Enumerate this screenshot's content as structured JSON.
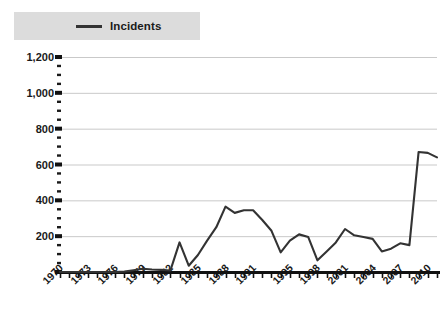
{
  "legend": {
    "label": "Incidents",
    "swatch_color": "#333333",
    "background_color": "#dcdcdc"
  },
  "axis": {
    "y_tick_labels": [
      "1,200",
      "1,000",
      "800",
      "600",
      "400",
      "200"
    ],
    "x_tick_labels": [
      "1970",
      "1973",
      "1976",
      "1979",
      "1982",
      "1985",
      "1988",
      "1991",
      "1995",
      "1998",
      "2001",
      "2004",
      "2007",
      "2010"
    ]
  },
  "chart_data": {
    "type": "line",
    "title": "",
    "xlabel": "",
    "ylabel": "",
    "ylim": [
      0,
      1200
    ],
    "ytick_values": [
      0,
      200,
      400,
      600,
      800,
      1000,
      1200
    ],
    "ytick_labels": [
      "",
      "200",
      "400",
      "600",
      "800",
      "1,000",
      "1,200"
    ],
    "minor_yticks": true,
    "grid": "horizontal",
    "legend_position": "top-left",
    "line_color": "#333333",
    "line_width": 2,
    "x": [
      1970,
      1971,
      1972,
      1973,
      1974,
      1975,
      1976,
      1977,
      1978,
      1979,
      1980,
      1981,
      1982,
      1983,
      1984,
      1985,
      1986,
      1987,
      1988,
      1989,
      1990,
      1991,
      1992,
      1993,
      1994,
      1995,
      1996,
      1997,
      1998,
      1999,
      2000,
      2001,
      2002,
      2003,
      2004,
      2005,
      2006,
      2007,
      2008,
      2009,
      2010,
      2011
    ],
    "xtick_labels_shown": [
      "1970",
      "1973",
      "1976",
      "1979",
      "1982",
      "1985",
      "1988",
      "1991",
      "1995",
      "1998",
      "2001",
      "2004",
      "2007",
      "2010"
    ],
    "series": [
      {
        "name": "Incidents",
        "values": [
          0,
          0,
          0,
          0,
          0,
          0,
          0,
          2,
          10,
          18,
          14,
          12,
          8,
          165,
          35,
          95,
          175,
          250,
          365,
          330,
          345,
          345,
          290,
          230,
          110,
          175,
          210,
          195,
          65,
          115,
          165,
          240,
          205,
          195,
          185,
          115,
          130,
          160,
          150,
          670,
          665,
          640
        ]
      }
    ]
  },
  "plot_geometry": {
    "x_axis_left_px": 60,
    "x_axis_right_px": 437,
    "y_zero_px": 272,
    "y_top_px": 57
  }
}
